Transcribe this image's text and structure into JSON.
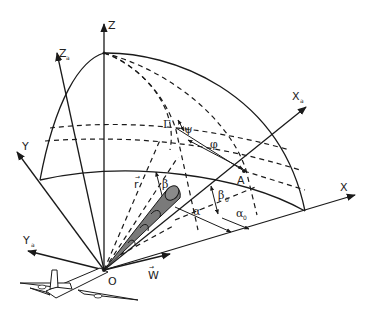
{
  "diagram": {
    "colors": {
      "line": "#1a1a1a",
      "beam_fill": "#7a7a7a",
      "aircraft_fill": "#ffffff",
      "background": "#ffffff"
    },
    "axes": {
      "z": "Z",
      "z_a": "Z",
      "z_a_sub": "a",
      "y": "Y",
      "y_a": "Y",
      "y_a_sub": "a",
      "x": "X",
      "x_a": "X",
      "x_a_sub": "a"
    },
    "points": {
      "origin": "O",
      "a": "A"
    },
    "vectors": {
      "r": "r",
      "w": "W"
    },
    "angles": {
      "gamma": "Γ",
      "psi": "ψ",
      "phi": "φ",
      "beta": "β",
      "beta_0": "β",
      "beta_0_sub": "0",
      "alpha": "α",
      "alpha_0": "α",
      "alpha_0_sub": "0"
    }
  }
}
